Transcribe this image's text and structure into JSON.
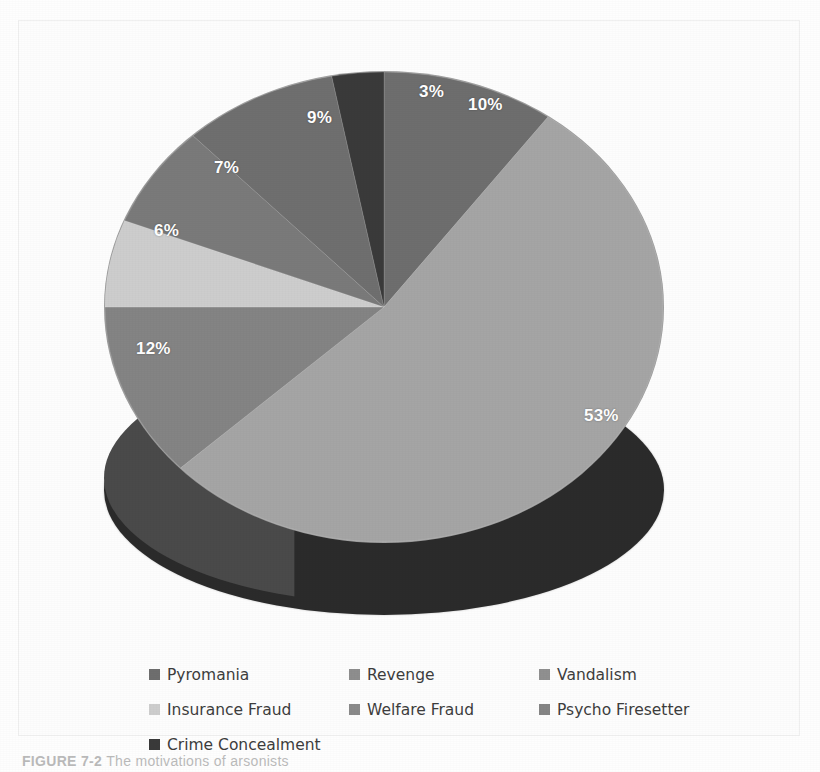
{
  "figure": {
    "caption_label": "FIGURE 7-2",
    "caption_text": "The motivations of arsonists"
  },
  "chart_data": {
    "type": "pie",
    "title": "",
    "subtitle": "",
    "xlabel": "",
    "ylabel": "",
    "three_d": true,
    "grid": false,
    "legend_position": "bottom",
    "value_unit": "%",
    "categories": [
      "Pyromania",
      "Revenge",
      "Vandalism",
      "Insurance Fraud",
      "Psycho Firesetter",
      "Welfare Fraud",
      "Crime Concealment"
    ],
    "values": [
      10,
      53,
      12,
      6,
      7,
      9,
      3
    ],
    "slice_order_clockwise_from_top": [
      "Pyromania",
      "Revenge",
      "Vandalism",
      "Insurance Fraud",
      "Psycho Firesetter",
      "Welfare Fraud",
      "Crime Concealment"
    ],
    "colors": {
      "Pyromania": "#6e6e6e",
      "Revenge": "#a5a5a5",
      "Vandalism": "#848484",
      "Insurance Fraud": "#cdcdcd",
      "Psycho Firesetter": "#7a7a7a",
      "Welfare Fraud": "#6f6f6f",
      "Crime Concealment": "#3a3a3a"
    },
    "side_wall_color": "#2b2b2b",
    "data_label_color": "#ffffff",
    "data_labels": [
      "10%",
      "53%",
      "12%",
      "6%",
      "7%",
      "9%",
      "3%"
    ]
  },
  "slices": [
    {
      "name": "Pyromania",
      "label": "10%",
      "value": 10,
      "color": "#6e6e6e"
    },
    {
      "name": "Revenge",
      "label": "53%",
      "value": 53,
      "color": "#a5a5a5"
    },
    {
      "name": "Vandalism",
      "label": "12%",
      "value": 12,
      "color": "#848484"
    },
    {
      "name": "Insurance Fraud",
      "label": "6%",
      "value": 6,
      "color": "#cdcdcd"
    },
    {
      "name": "Psycho Firesetter",
      "label": "7%",
      "value": 7,
      "color": "#7a7a7a"
    },
    {
      "name": "Welfare Fraud",
      "label": "9%",
      "value": 9,
      "color": "#6f6f6f"
    },
    {
      "name": "Crime Concealment",
      "label": "3%",
      "value": 3,
      "color": "#3a3a3a"
    }
  ],
  "legend": {
    "rows": [
      [
        {
          "label": "Pyromania",
          "color": "#6e6e6e"
        },
        {
          "label": "Revenge",
          "color": "#8e8e8e"
        },
        {
          "label": "Vandalism",
          "color": "#909090"
        }
      ],
      [
        {
          "label": "Insurance Fraud",
          "color": "#cdcdcd"
        },
        {
          "label": "Welfare Fraud",
          "color": "#8a8a8a"
        },
        {
          "label": "Psycho Firesetter",
          "color": "#858585"
        }
      ],
      [
        {
          "label": "Crime Concealment",
          "color": "#3a3a3a"
        }
      ]
    ]
  }
}
